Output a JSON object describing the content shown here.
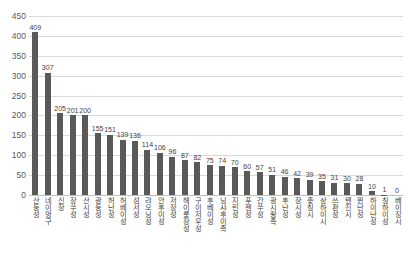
{
  "chart_data": {
    "type": "bar",
    "title": "",
    "subtitle": "",
    "xlabel": "",
    "ylabel": "",
    "ylim": [
      0,
      450
    ],
    "ytick_step": 50,
    "yticks": [
      0,
      50,
      100,
      150,
      200,
      250,
      300,
      350,
      400,
      450
    ],
    "grid": true,
    "legend": false,
    "legend_position": "none",
    "bar_color": "#595959",
    "gridline_color": "#d9d9d9",
    "data_labels": true,
    "categories": [
      "산둥성",
      "네이멍구",
      "신장",
      "장쑤성",
      "산시성",
      "광둥성",
      "허난성",
      "허베이성",
      "섬서성",
      "랴오닝성",
      "안후이성",
      "저장성",
      "헤이룽장성",
      "구이저우성",
      "후베이성",
      "닝샤후이족",
      "지린성",
      "푸젠성",
      "간쑤성",
      "광시좡족",
      "후난성",
      "장시성",
      "충칭시",
      "상하이시",
      "쓰촨성",
      "톈진시",
      "윈난성",
      "하이난성",
      "칭하이성",
      "베이징시"
    ],
    "values": [
      409,
      307,
      205,
      201,
      200,
      155,
      151,
      139,
      136,
      114,
      106,
      96,
      87,
      82,
      75,
      74,
      70,
      60,
      57,
      51,
      46,
      42,
      39,
      35,
      31,
      30,
      28,
      10,
      1,
      0
    ]
  }
}
